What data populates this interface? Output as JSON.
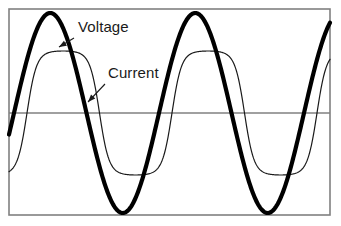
{
  "figure": {
    "background_color": "#ffffff",
    "frame": {
      "name": "plot-frame",
      "color": "#808080",
      "stroke_width": 1.6,
      "x": 9,
      "y": 9,
      "width": 321,
      "height": 206
    },
    "zero_axis": {
      "name": "zero-axis-line",
      "color": "#808080",
      "stroke_width": 1.6,
      "y": 113
    }
  },
  "labels": [
    {
      "id": "voltage",
      "text": "Voltage",
      "x": 78,
      "y": 32,
      "font_size": 15,
      "color": "#1a1a1a",
      "leader": {
        "x1": 74,
        "y1": 38,
        "x2": 59,
        "y2": 47
      }
    },
    {
      "id": "current",
      "text": "Current",
      "x": 108,
      "y": 78,
      "font_size": 15,
      "color": "#1a1a1a",
      "leader": {
        "x1": 105,
        "y1": 84,
        "x2": 88,
        "y2": 102
      }
    }
  ],
  "series": [
    {
      "id": "voltage",
      "label": "Voltage",
      "color": "#000000",
      "stroke_width": 4.2,
      "shape": "sine",
      "amplitude_px": 98,
      "period_px": 145,
      "phase_deg": -25,
      "description": "thick smooth sinusoid, leads the current"
    },
    {
      "id": "current",
      "label": "Current",
      "color": "#1a1a1a",
      "stroke_width": 1.2,
      "shape": "flat-topped-distorted-sine",
      "amplitude_px": 62,
      "period_px": 145,
      "phase_deg": -50,
      "description": "thin distorted sinusoid with flattened peaks, lags the voltage"
    }
  ],
  "chart_data": {
    "type": "line",
    "subtitle": "",
    "xlabel": "",
    "ylabel": "",
    "grid": false,
    "legend": "annotations",
    "xlim": [
      0,
      341
    ],
    "ylim": [
      -110,
      110
    ],
    "axis_zero_y": 113,
    "annotations": [
      "Voltage",
      "Current"
    ],
    "series": [
      {
        "name": "Voltage",
        "style": "thick-black-sine",
        "peak_points": [
          {
            "x": 50,
            "y": 13
          },
          {
            "x": 195,
            "y": 13
          }
        ],
        "trough_points": [
          {
            "x": 123,
            "y": 208
          },
          {
            "x": 268,
            "y": 208
          }
        ],
        "zero_crossings": [
          {
            "x": 14,
            "dir": "rising"
          },
          {
            "x": 87,
            "dir": "falling"
          },
          {
            "x": 160,
            "dir": "rising"
          },
          {
            "x": 232,
            "dir": "falling"
          },
          {
            "x": 305,
            "dir": "rising"
          }
        ],
        "amplitude": 100,
        "period": 145,
        "phase_lead_deg": 25
      },
      {
        "name": "Current",
        "style": "thin-black-distorted-sine",
        "peak_points": [
          {
            "x": 59,
            "y": 51
          },
          {
            "x": 204,
            "y": 51
          }
        ],
        "trough_points": [
          {
            "x": 140,
            "y": 176
          },
          {
            "x": 285,
            "y": 176
          }
        ],
        "zero_crossings": [
          {
            "x": 27,
            "dir": "rising"
          },
          {
            "x": 100,
            "dir": "falling"
          },
          {
            "x": 172,
            "dir": "rising"
          },
          {
            "x": 245,
            "dir": "falling"
          },
          {
            "x": 318,
            "dir": "rising"
          }
        ],
        "amplitude": 62,
        "period": 145,
        "phase_lag_deg": 32,
        "distortion": "flat-topped"
      }
    ]
  }
}
